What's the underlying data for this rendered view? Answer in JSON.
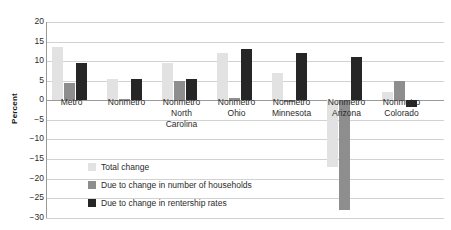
{
  "chart_data": {
    "type": "bar",
    "title": "",
    "xlabel": "",
    "ylabel": "Percent",
    "ylim": [
      -30,
      20
    ],
    "ytick_step": 5,
    "grid": true,
    "legend_position": "inside-bottom-left",
    "categories": [
      "Metro",
      "Nonmetro",
      "Nonmetro\nNorth\nCarolina",
      "Nonmetro\nOhio",
      "Nonmetro\nMinnesota",
      "Nonmetro\nArizona",
      "Nonmetro\nColorado"
    ],
    "yticks": [
      20,
      15,
      10,
      5,
      0,
      -5,
      -10,
      -15,
      -20,
      -25,
      -30
    ],
    "ytick_labels": [
      "20",
      "15",
      "10",
      "5",
      "0",
      "−5",
      "−10",
      "−15",
      "−20",
      "−25",
      "−30"
    ],
    "series": [
      {
        "name": "Total change",
        "color": "#e2e2e2",
        "values": [
          13.6,
          5.4,
          9.6,
          12.0,
          7.0,
          -17.0,
          2.0
        ]
      },
      {
        "name": "Due to change in number of households",
        "color": "#8e8e8e",
        "values": [
          4.4,
          0.3,
          4.8,
          0.6,
          -0.6,
          -28.0,
          5.0
        ]
      },
      {
        "name": "Due to change in rentership rates",
        "color": "#262626",
        "values": [
          9.4,
          5.5,
          5.3,
          13.0,
          12.0,
          11.0,
          -1.8
        ]
      }
    ]
  },
  "legend": {
    "items": [
      {
        "label": "Total change",
        "color": "#e2e2e2"
      },
      {
        "label": "Due to change in number of households",
        "color": "#8e8e8e"
      },
      {
        "label": "Due to change in rentership rates",
        "color": "#262626"
      }
    ]
  }
}
